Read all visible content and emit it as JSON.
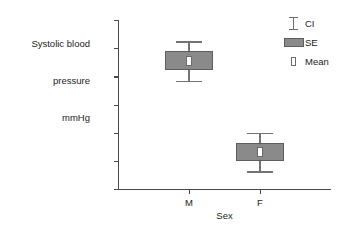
{
  "chart_data": {
    "type": "bar",
    "title": "",
    "ylabel": "Systolic blood\npressure\nmmHg",
    "ylabel_lines": [
      "Systolic blood",
      "pressure",
      "mmHg"
    ],
    "xlabel": "Sex",
    "categories": [
      "M",
      "F"
    ],
    "ylim": [
      124,
      148
    ],
    "yticks": [
      124,
      128,
      132,
      136,
      140,
      144,
      148
    ],
    "grid": false,
    "legend_position": "top-right",
    "legend": [
      {
        "key": "ci-whisker-key",
        "label": "CI"
      },
      {
        "key": "se-box-key",
        "label": "SE"
      },
      {
        "key": "mean-marker-key",
        "label": "Mean"
      }
    ],
    "series": [
      {
        "name": "M",
        "mean": 142.2,
        "se_low": 140.9,
        "se_high": 143.6,
        "ci_low": 139.4,
        "ci_high": 145.0
      },
      {
        "name": "F",
        "mean": 129.2,
        "se_low": 128.0,
        "se_high": 130.5,
        "ci_low": 126.5,
        "ci_high": 132.0
      }
    ],
    "colors": {
      "se_fill": "#8a8a8a",
      "se_edge": "#5e5e5e",
      "ci_line": "#737373",
      "mean_fill": "#ffffff",
      "mean_edge": "#6b6b6b",
      "axis": "#4a4a4a",
      "text": "#1c1c1c",
      "background": "#ffffff"
    }
  }
}
